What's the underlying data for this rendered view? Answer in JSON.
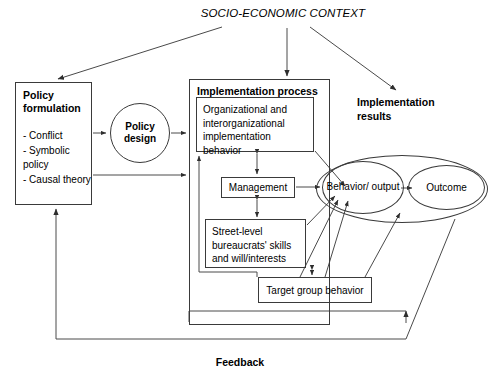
{
  "diagram": {
    "title": "SOCIO-ECONOMIC CONTEXT",
    "stroke_color": "#3a3a3a",
    "text_color": "#000000",
    "background": "#ffffff",
    "nodes": {
      "policy_formulation": {
        "heading": "Policy formulation",
        "items": [
          "- Conflict",
          "- Symbolic",
          "  policy",
          "- Causal theory"
        ]
      },
      "policy_design": {
        "label": "Policy design"
      },
      "implementation_process": {
        "heading": "Implementation process"
      },
      "organizational_behavior": {
        "label": "Organizational and interorganizational implementation behavior"
      },
      "management": {
        "label": "Management"
      },
      "street_level": {
        "label": "Street-level bureaucrats' skills and will/interests"
      },
      "target_group": {
        "label": "Target group behavior"
      },
      "behavior_output": {
        "label": "Behavior/ output"
      },
      "outcome": {
        "label": "Outcome"
      }
    },
    "labels": {
      "implementation_results": "Implementation results",
      "feedback": "Feedback"
    }
  }
}
